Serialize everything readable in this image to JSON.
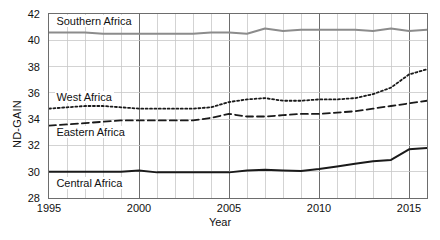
{
  "chart_data": {
    "type": "line",
    "title": "",
    "xlabel": "Year",
    "ylabel": "ND-GAIN",
    "xlim": [
      1995,
      2016
    ],
    "ylim": [
      28,
      42
    ],
    "grid": true,
    "legend_position": "in-plot-labels",
    "xticks": [
      1995,
      2000,
      2005,
      2010,
      2015
    ],
    "yticks": [
      28,
      30,
      32,
      34,
      36,
      38,
      40,
      42
    ],
    "x": [
      1995,
      1996,
      1997,
      1998,
      1999,
      2000,
      2001,
      2002,
      2003,
      2004,
      2005,
      2006,
      2007,
      2008,
      2009,
      2010,
      2011,
      2012,
      2013,
      2014,
      2015,
      2016
    ],
    "series": [
      {
        "name": "Southern Africa",
        "style": "solid",
        "color": "#8c8c8c",
        "width": 2.0,
        "label_x": 1995.3,
        "label_y": 41.55,
        "values": [
          40.6,
          40.6,
          40.6,
          40.5,
          40.5,
          40.5,
          40.5,
          40.5,
          40.5,
          40.6,
          40.6,
          40.5,
          40.9,
          40.7,
          40.8,
          40.8,
          40.8,
          40.8,
          40.7,
          40.9,
          40.7,
          40.8
        ]
      },
      {
        "name": "West Africa",
        "style": "dotted",
        "color": "#1a1a1a",
        "width": 1.8,
        "label_x": 1995.3,
        "label_y": 35.75,
        "values": [
          34.8,
          34.9,
          35.0,
          35.0,
          34.9,
          34.8,
          34.8,
          34.8,
          34.8,
          34.9,
          35.3,
          35.5,
          35.6,
          35.4,
          35.4,
          35.5,
          35.5,
          35.6,
          35.9,
          36.4,
          37.4,
          37.8
        ]
      },
      {
        "name": "Eastern Africa",
        "style": "dashed",
        "color": "#1a1a1a",
        "width": 1.8,
        "label_x": 1995.3,
        "label_y": 33.1,
        "values": [
          33.5,
          33.6,
          33.7,
          33.8,
          33.9,
          33.9,
          33.9,
          33.9,
          33.9,
          34.1,
          34.4,
          34.2,
          34.2,
          34.3,
          34.4,
          34.4,
          34.5,
          34.6,
          34.8,
          35.0,
          35.2,
          35.4
        ]
      },
      {
        "name": "Central Africa",
        "style": "solid",
        "color": "#1a1a1a",
        "width": 2.0,
        "label_x": 1995.3,
        "label_y": 29.2,
        "values": [
          30.0,
          30.0,
          30.0,
          30.0,
          30.0,
          30.1,
          29.95,
          29.95,
          29.95,
          29.95,
          29.95,
          30.1,
          30.15,
          30.1,
          30.05,
          30.2,
          30.4,
          30.6,
          30.8,
          30.9,
          31.7,
          31.8
        ]
      }
    ]
  }
}
